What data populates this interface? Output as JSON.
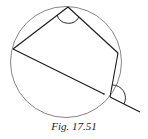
{
  "figure": {
    "caption": "Fig. 17.51"
  },
  "colors": {
    "stroke": "#1a1a1a",
    "circle": "#555555",
    "background": "#ffffff"
  }
}
